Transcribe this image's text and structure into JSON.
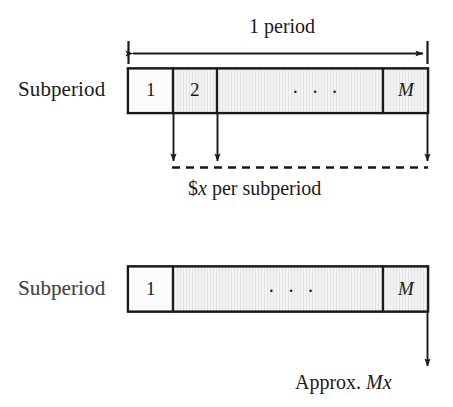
{
  "figure": {
    "background_color": "#ffffff",
    "ink_color": "#1a1a1a",
    "cell_fill_color": "#f2f2f2"
  },
  "top_diagram": {
    "dimension_label": "1 period",
    "row_label": "Subperiod",
    "cells": [
      {
        "label": "1",
        "italic": false
      },
      {
        "label": "2",
        "italic": false
      },
      {
        "label": "· · ·",
        "italic": false
      },
      {
        "label": "M",
        "italic": true
      }
    ],
    "flow_caption_parts": {
      "prefix": "$",
      "variable": "x",
      "suffix": " per subperiod"
    },
    "flow_caption_plain": "$x per subperiod",
    "arrow_count": 3
  },
  "bottom_diagram": {
    "row_label": "Subperiod",
    "cells": [
      {
        "label": "1",
        "italic": false
      },
      {
        "label": "· · ·",
        "italic": false
      },
      {
        "label": "M",
        "italic": true
      }
    ],
    "flow_caption_parts": {
      "prefix": "Approx. ",
      "variable": "Mx"
    },
    "flow_caption_plain": "Approx. Mx",
    "arrow_count": 1
  }
}
